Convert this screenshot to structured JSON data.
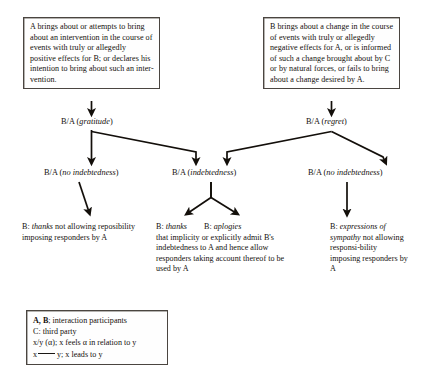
{
  "diagram": {
    "line_color": "#17130f",
    "box_border_color": "#4a4540",
    "background": "#ffffff"
  },
  "premises": {
    "left": {
      "lead": "A",
      "text": "A brings about or attempts to bring about an intervention in the course of events with truly or allegedly positive effects for B; or declares his intention to bring about such an inter-vention."
    },
    "right": {
      "lead": "B",
      "text": "B brings about a change in the course of events with truly or allegedly negative effects for A, or is informed of such a change brought about by C or by natural forces, or fails to bring about a change desired by A."
    }
  },
  "tree": {
    "level1": [
      {
        "prefix": "B/A (",
        "emphasis": "gratitude",
        "suffix": ")"
      },
      {
        "prefix": "B/A (",
        "emphasis": "regret",
        "suffix": ")"
      }
    ],
    "level2": [
      {
        "prefix": "B/A (",
        "emphasis": "no indebtedness",
        "suffix": ")"
      },
      {
        "prefix": "B/A (",
        "emphasis": "indebtedness",
        "suffix": ")"
      },
      {
        "prefix": "B/A (",
        "emphasis": "no indebtedness",
        "suffix": ")"
      }
    ]
  },
  "leaves": {
    "left": {
      "lead": "B:",
      "emphasis": "thanks",
      "body": "not allowing reposibility imposing responders by A"
    },
    "middle": {
      "head_one_lead": "B:",
      "head_one_emphasis": "thanks",
      "head_two_lead": "B:",
      "head_two_emphasis": "aplogies",
      "body": "that implicity or explicitly admit B's indebtedness to A and hence allow responders taking account thereof to be used by A"
    },
    "right": {
      "lead": "B:",
      "emphasis": "expressions of sympathy",
      "body": "not allowing responsi-bility imposing responders by A"
    }
  },
  "legend": {
    "rows": [
      {
        "key": "A, B",
        "bold": true,
        "text": "; interaction participants"
      },
      {
        "key": "C",
        "bold": false,
        "text": ": third party"
      },
      {
        "key": "x/y (α)",
        "bold": false,
        "text": "; x feels α in relation to y"
      }
    ],
    "arrow_row": {
      "from": "x",
      "to": "y",
      "text": "; x leads to y"
    }
  }
}
